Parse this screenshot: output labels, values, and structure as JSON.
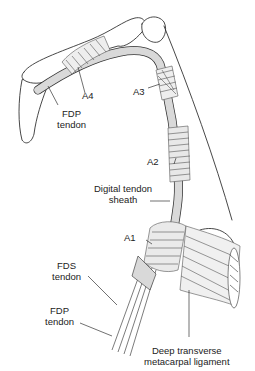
{
  "figure": {
    "colors": {
      "outline": "#333333",
      "tendon_fill": "#d9d9d9",
      "pulley_stroke": "#555555",
      "background": "#ffffff"
    }
  },
  "labels": {
    "a4": "A4",
    "a3": "A3",
    "a2": "A2",
    "a1": "A1",
    "fdp_distal_line1": "FDP",
    "fdp_distal_line2": "tendon",
    "digital_sheath_line1": "Digital tendon",
    "digital_sheath_line2": "sheath",
    "fds_line1": "FDS",
    "fds_line2": "tendon",
    "fdp_proximal_line1": "FDP",
    "fdp_proximal_line2": "tendon",
    "dtml_line1": "Deep transverse",
    "dtml_line2": "metacarpal ligament"
  }
}
